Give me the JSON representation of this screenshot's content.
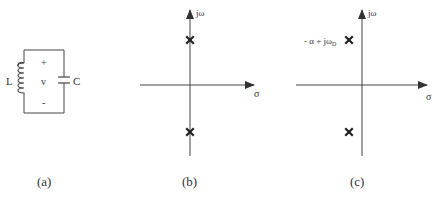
{
  "figure": {
    "panels": [
      {
        "id": "a",
        "caption": "(a)",
        "type": "LC circuit",
        "components": {
          "inductor_label": "L",
          "capacitor_label": "C",
          "voltage_label": "v",
          "plus_sign": "+",
          "minus_sign": "-"
        }
      },
      {
        "id": "b",
        "caption": "(b)",
        "type": "s-plane pole plot",
        "axes": {
          "vertical_label": "jω",
          "horizontal_label": "σ"
        },
        "poles": [
          {
            "position": "positive imaginary axis",
            "marker": "x"
          },
          {
            "position": "negative imaginary axis",
            "marker": "x"
          }
        ]
      },
      {
        "id": "c",
        "caption": "(c)",
        "type": "s-plane pole plot",
        "axes": {
          "vertical_label": "jω",
          "horizontal_label": "σ"
        },
        "pole_annotation": {
          "prefix": "- α + jω",
          "subscript": "D"
        },
        "poles": [
          {
            "position": "left half-plane upper",
            "marker": "x"
          },
          {
            "position": "left half-plane lower",
            "marker": "x"
          }
        ]
      }
    ],
    "colors": {
      "stroke": "#444444",
      "text": "#333333",
      "background": "#ffffff"
    }
  }
}
